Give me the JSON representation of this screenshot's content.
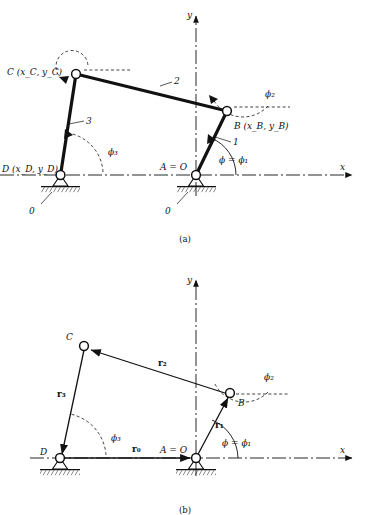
{
  "figure": {
    "caption_a": "(a)",
    "caption_b": "(b)",
    "axis": {
      "x_label": "x",
      "y_label": "y"
    }
  },
  "panel_a": {
    "points": {
      "C": "C (x_C, y_C)",
      "B": "B (x_B, y_B)",
      "D": "D (x_D, y_D)",
      "A": "A = O"
    },
    "links": {
      "link1": "1",
      "link2": "2",
      "link3": "3",
      "ground_left": "0",
      "ground_right": "0"
    },
    "angles": {
      "phi1": "ϕ = ϕ₁",
      "phi2": "ϕ₂",
      "phi3": "ϕ₃"
    }
  },
  "panel_b": {
    "points": {
      "C": "C",
      "B": "B",
      "D": "D",
      "A": "A = O"
    },
    "vectors": {
      "r0": "r₀",
      "r1": "r₁",
      "r2": "r₂",
      "r3": "r₃"
    },
    "angles": {
      "phi1": "ϕ = ϕ₁",
      "phi2": "ϕ₂",
      "phi3": "ϕ₃"
    }
  },
  "colors": {
    "ink": "#111111",
    "line": "#1a1a1a",
    "joint_fill": "#ffffff"
  }
}
